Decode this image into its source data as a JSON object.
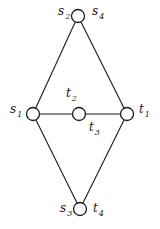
{
  "diagram": {
    "type": "graph",
    "nodes": [
      {
        "id": "top",
        "x": 78,
        "y": 16,
        "r": 6.5,
        "labels": [
          {
            "base": "s",
            "sub": "2",
            "x": 58,
            "y": 15
          },
          {
            "base": "s",
            "sub": "4",
            "x": 92,
            "y": 15
          }
        ]
      },
      {
        "id": "left",
        "x": 33,
        "y": 114,
        "r": 6.5,
        "labels": [
          {
            "base": "s",
            "sub": "1",
            "x": 10,
            "y": 113
          }
        ]
      },
      {
        "id": "middle",
        "x": 79,
        "y": 114,
        "r": 6.5,
        "labels": [
          {
            "base": "t",
            "sub": "2",
            "x": 66,
            "y": 97
          },
          {
            "base": "t",
            "sub": "3",
            "x": 89,
            "y": 131
          }
        ]
      },
      {
        "id": "right",
        "x": 127,
        "y": 114,
        "r": 6.5,
        "labels": [
          {
            "base": "t",
            "sub": "1",
            "x": 139,
            "y": 113
          }
        ]
      },
      {
        "id": "bottom",
        "x": 80,
        "y": 209,
        "r": 6.5,
        "labels": [
          {
            "base": "s",
            "sub": "3",
            "x": 60,
            "y": 212
          },
          {
            "base": "t",
            "sub": "4",
            "x": 93,
            "y": 212
          }
        ]
      }
    ],
    "edges": [
      [
        "top",
        "left"
      ],
      [
        "top",
        "right"
      ],
      [
        "left",
        "middle"
      ],
      [
        "middle",
        "right"
      ],
      [
        "left",
        "bottom"
      ],
      [
        "right",
        "bottom"
      ]
    ],
    "colors": {
      "stroke": "#1a1a1a",
      "background": "#ffffff"
    }
  }
}
